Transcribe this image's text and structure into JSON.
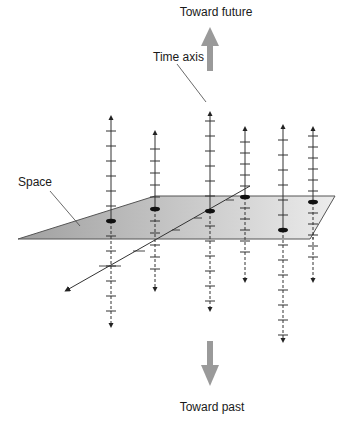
{
  "labels": {
    "future": "Toward future",
    "past": "Toward past",
    "time_axis": "Time axis",
    "space": "Space"
  },
  "colors": {
    "plane_fill_dark": "#a8a8a8",
    "plane_fill_light": "#e6e6e6",
    "plane_stroke": "#555555",
    "direction_arrow": "#9a9a9a",
    "axis_line": "#333333"
  },
  "time_axes": [
    {
      "name": "time-axis-1",
      "ticks_above": 6,
      "ticks_below": 6
    },
    {
      "name": "time-axis-2",
      "ticks_above": 6,
      "ticks_below": 5
    },
    {
      "name": "time-axis-3",
      "ticks_above": 6,
      "ticks_below": 6
    },
    {
      "name": "time-axis-4",
      "ticks_above": 6,
      "ticks_below": 5
    },
    {
      "name": "time-axis-5",
      "ticks_above": 6,
      "ticks_below": 7
    },
    {
      "name": "time-axis-6",
      "ticks_above": 6,
      "ticks_below": 5
    }
  ]
}
